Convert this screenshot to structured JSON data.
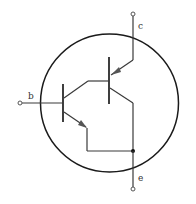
{
  "diagram": {
    "type": "darlington-transistor-symbol",
    "labels": {
      "collector": "c",
      "base": "b",
      "emitter": "e"
    },
    "colors": {
      "line": "#3a3a3a",
      "circle": "#1a1a1a",
      "background": "#ffffff"
    }
  }
}
